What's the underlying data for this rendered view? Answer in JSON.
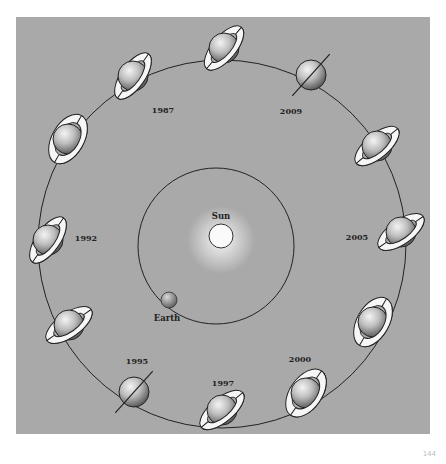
{
  "diagram": {
    "background_color": "#a9a9a9",
    "sun": {
      "label": "Sun",
      "cx": 221,
      "cy": 236,
      "r": 12
    },
    "earth": {
      "label": "Earth",
      "cx": 169,
      "cy": 300,
      "r": 8
    },
    "earth_orbit": {
      "cx": 216,
      "cy": 246,
      "r": 78
    },
    "saturn_orbit": {
      "cx": 222,
      "cy": 244,
      "r": 184
    },
    "year_labels": [
      {
        "text": "1987",
        "x": 163,
        "y": 113
      },
      {
        "text": "2009",
        "x": 291,
        "y": 114
      },
      {
        "text": "1992",
        "x": 86,
        "y": 241
      },
      {
        "text": "2005",
        "x": 357,
        "y": 240
      },
      {
        "text": "1995",
        "x": 137,
        "y": 364
      },
      {
        "text": "1997",
        "x": 223,
        "y": 386
      },
      {
        "text": "2000",
        "x": 300,
        "y": 362
      }
    ],
    "saturns": [
      {
        "id": "top-left-upper",
        "cx": 133,
        "cy": 76,
        "rings": "open",
        "tilt": -55
      },
      {
        "id": "top",
        "cx": 224,
        "cy": 48,
        "rings": "open",
        "tilt": -50
      },
      {
        "id": "2009",
        "cx": 311,
        "cy": 75,
        "rings": "edge-on",
        "tilt": -48
      },
      {
        "id": "right-upper",
        "cx": 377,
        "cy": 146,
        "rings": "open",
        "tilt": -40
      },
      {
        "id": "right",
        "cx": 401,
        "cy": 232,
        "rings": "open",
        "tilt": -35
      },
      {
        "id": "right-lower",
        "cx": 373,
        "cy": 322,
        "rings": "wide-open",
        "tilt": -60
      },
      {
        "id": "bottom-right",
        "cx": 306,
        "cy": 393,
        "rings": "wide-open",
        "tilt": -55
      },
      {
        "id": "bottom",
        "cx": 222,
        "cy": 410,
        "rings": "open",
        "tilt": -40
      },
      {
        "id": "1995",
        "cx": 134,
        "cy": 392,
        "rings": "edge-on",
        "tilt": -48
      },
      {
        "id": "left-lower",
        "cx": 69,
        "cy": 325,
        "rings": "open",
        "tilt": -35
      },
      {
        "id": "left",
        "cx": 48,
        "cy": 240,
        "rings": "open",
        "tilt": -55
      },
      {
        "id": "left-upper",
        "cx": 68,
        "cy": 139,
        "rings": "wide-open",
        "tilt": -60
      }
    ],
    "page_number": "144"
  }
}
